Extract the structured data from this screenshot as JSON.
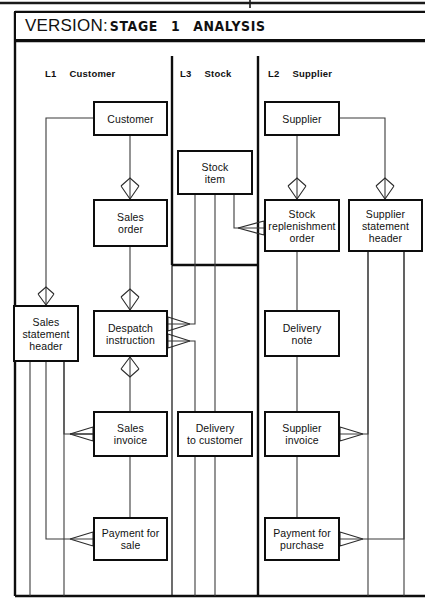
{
  "diagram": {
    "kind": "logical-data-structure",
    "title_label": "VERSION:",
    "title_value_parts": [
      "STAGE",
      "1",
      "ANALYSIS"
    ],
    "title_value": "STAGE 1 ANALYSIS"
  },
  "lanes": [
    {
      "code": "L1",
      "name": "Customer"
    },
    {
      "code": "L3",
      "name": "Stock"
    },
    {
      "code": "L2",
      "name": "Supplier"
    }
  ],
  "entities": [
    {
      "id": "customer",
      "label": "Customer",
      "lane": "L1",
      "x": 93,
      "y": 101,
      "w": 75,
      "h": 35
    },
    {
      "id": "sales-order",
      "label": "Sales\norder",
      "lane": "L1",
      "x": 93,
      "y": 199,
      "w": 75,
      "h": 48
    },
    {
      "id": "sales-statement-header",
      "label": "Sales\nstatement\nheader",
      "lane": "L1",
      "x": 13,
      "y": 305,
      "w": 66,
      "h": 57
    },
    {
      "id": "despatch-instruction",
      "label": "Despatch\ninstruction",
      "lane": "L1",
      "x": 93,
      "y": 310,
      "w": 75,
      "h": 47
    },
    {
      "id": "sales-invoice",
      "label": "Sales\ninvoice",
      "lane": "L1",
      "x": 93,
      "y": 411,
      "w": 75,
      "h": 46
    },
    {
      "id": "payment-for-sale",
      "label": "Payment for\nsale",
      "lane": "L1",
      "x": 93,
      "y": 517,
      "w": 75,
      "h": 44
    },
    {
      "id": "stock-item",
      "label": "Stock\nitem",
      "lane": "L3",
      "x": 177,
      "y": 150,
      "w": 76,
      "h": 45
    },
    {
      "id": "delivery-to-customer",
      "label": "Delivery\nto customer",
      "lane": "L3",
      "x": 177,
      "y": 411,
      "w": 76,
      "h": 46
    },
    {
      "id": "supplier",
      "label": "Supplier",
      "lane": "L2",
      "x": 264,
      "y": 101,
      "w": 76,
      "h": 35
    },
    {
      "id": "stock-replenishment-order",
      "label": "Stock\nreplenishment\norder",
      "lane": "L2",
      "x": 264,
      "y": 199,
      "w": 76,
      "h": 53
    },
    {
      "id": "supplier-statement-header",
      "label": "Supplier\nstatement\nheader",
      "lane": "L2",
      "x": 348,
      "y": 199,
      "w": 75,
      "h": 53
    },
    {
      "id": "delivery-note",
      "label": "Delivery\nnote",
      "lane": "L2",
      "x": 264,
      "y": 310,
      "w": 76,
      "h": 47
    },
    {
      "id": "supplier-invoice",
      "label": "Supplier\ninvoice",
      "lane": "L2",
      "x": 264,
      "y": 411,
      "w": 76,
      "h": 46
    },
    {
      "id": "payment-for-purchase",
      "label": "Payment for\npurchase",
      "lane": "L2",
      "x": 264,
      "y": 517,
      "w": 76,
      "h": 44
    }
  ],
  "relationships": [
    {
      "from": "customer",
      "to": "sales-order",
      "crowsfoot": "sales-order"
    },
    {
      "from": "customer",
      "to": "sales-statement-header",
      "crowsfoot": "sales-statement-header"
    },
    {
      "from": "customer",
      "to": "payment-for-sale",
      "crowsfoot": "payment-for-sale"
    },
    {
      "from": "sales-order",
      "to": "despatch-instruction",
      "crowsfoot": "despatch-instruction"
    },
    {
      "from": "despatch-instruction",
      "to": "sales-invoice",
      "crowsfoot": "sales-invoice"
    },
    {
      "from": "despatch-instruction",
      "to": "delivery-to-customer",
      "crowsfoot": "despatch-instruction"
    },
    {
      "from": "despatch-instruction",
      "to": "stock-item",
      "crowsfoot": "despatch-instruction"
    },
    {
      "from": "sales-statement-header",
      "to": "sales-invoice",
      "crowsfoot": "sales-invoice"
    },
    {
      "from": "sales-invoice",
      "to": "payment-for-sale",
      "crowsfoot": "payment-for-sale"
    },
    {
      "from": "stock-item",
      "to": "stock-replenishment-order",
      "crowsfoot": "stock-replenishment-order"
    },
    {
      "from": "supplier",
      "to": "stock-replenishment-order",
      "crowsfoot": "stock-replenishment-order"
    },
    {
      "from": "supplier",
      "to": "supplier-statement-header",
      "crowsfoot": "supplier-statement-header"
    },
    {
      "from": "stock-replenishment-order",
      "to": "delivery-note",
      "crowsfoot": "none"
    },
    {
      "from": "delivery-note",
      "to": "supplier-invoice",
      "crowsfoot": "none"
    },
    {
      "from": "supplier-invoice",
      "to": "payment-for-purchase",
      "crowsfoot": "none"
    },
    {
      "from": "supplier-statement-header",
      "to": "supplier-invoice",
      "crowsfoot": "supplier-invoice"
    },
    {
      "from": "supplier-statement-header",
      "to": "payment-for-purchase",
      "crowsfoot": "payment-for-purchase"
    }
  ],
  "colors": {
    "ink": "#0d0d0d",
    "line": "#3a3a3a",
    "paper": "#ffffff"
  }
}
